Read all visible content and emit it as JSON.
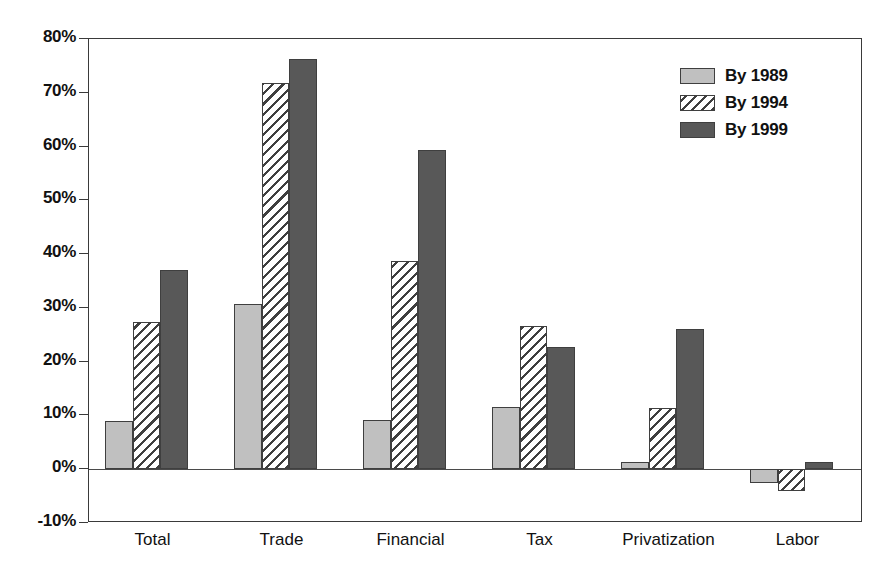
{
  "chart_data": {
    "type": "bar",
    "title": "",
    "subtitle": "",
    "xlabel": "",
    "ylabel": "",
    "categories": [
      "Total",
      "Trade",
      "Financial",
      "Tax",
      "Privatization",
      "Labor"
    ],
    "series": [
      {
        "name": "By 1989",
        "color": "#c0c0c0",
        "fill": "solid-light-gray",
        "values": [
          8.9,
          30.8,
          9.2,
          11.5,
          1.3,
          -2.5
        ]
      },
      {
        "name": "By 1994",
        "color": "#ffffff",
        "fill": "diagonal-hatch",
        "values": [
          27.3,
          71.8,
          38.7,
          26.7,
          11.3,
          -4.0
        ]
      },
      {
        "name": "By 1999",
        "color": "#585858",
        "fill": "solid-dark-gray",
        "values": [
          37.0,
          76.3,
          59.4,
          22.7,
          26.0,
          1.3
        ]
      }
    ],
    "ylim": [
      -10,
      80
    ],
    "ytick_values": [
      80,
      70,
      60,
      50,
      40,
      30,
      20,
      10,
      0,
      -10
    ],
    "ytick_labels": [
      "80%",
      "70%",
      "60%",
      "50%",
      "40%",
      "30%",
      "20%",
      "10%",
      "0%",
      "-10%"
    ],
    "grid": false,
    "legend_position": "top-right",
    "zero_line": true,
    "value_suffix": "%"
  },
  "legend": {
    "entries": [
      {
        "label": "By 1989"
      },
      {
        "label": "By 1994"
      },
      {
        "label": "By 1999"
      }
    ]
  },
  "axis": {
    "y_labels": [
      "80%",
      "70%",
      "60%",
      "50%",
      "40%",
      "30%",
      "20%",
      "10%",
      "0%",
      "-10%"
    ],
    "x_labels": [
      "Total",
      "Trade",
      "Financial",
      "Tax",
      "Privatization",
      "Labor"
    ]
  },
  "colors": {
    "series_1989": "#c0c0c0",
    "series_1994": "#ffffff",
    "series_1999": "#585858",
    "axis": "#3a3a3a",
    "text": "#111111",
    "background": "#ffffff"
  }
}
